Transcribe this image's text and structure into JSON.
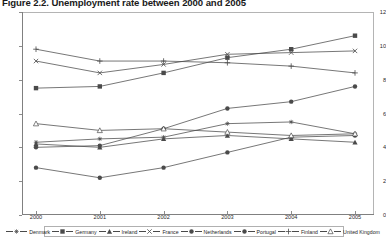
{
  "title": "Figure 2.2. Unemployment rate between 2000 and 2005",
  "axis": {
    "yticks": [
      "12",
      "10",
      "8",
      "6",
      "4",
      "2",
      "0"
    ],
    "xticks": [
      "2000",
      "2001",
      "2002",
      "2003",
      "2004",
      "2005"
    ]
  },
  "legend": {
    "items": [
      {
        "label": "Denmark",
        "marker": "asterisk-marker"
      },
      {
        "label": "Germany",
        "marker": "filled-square-marker"
      },
      {
        "label": "Ireland",
        "marker": "filled-triangle-marker"
      },
      {
        "label": "France",
        "marker": "cross-x-marker"
      },
      {
        "label": "Netherlands",
        "marker": "filled-circle-marker"
      },
      {
        "label": "Portugal",
        "marker": "filled-circle-marker"
      },
      {
        "label": "Finland",
        "marker": "plus-marker"
      },
      {
        "label": "United Kingdom",
        "marker": "open-triangle-marker"
      }
    ]
  },
  "chart_data": {
    "type": "line",
    "title": "Figure 2.2. Unemployment rate between 2000 and 2005",
    "xlabel": "",
    "ylabel": "",
    "x": [
      2000,
      2001,
      2002,
      2003,
      2004,
      2005
    ],
    "categories": [
      "2000",
      "2001",
      "2002",
      "2003",
      "2004",
      "2005"
    ],
    "ylim": [
      0,
      12
    ],
    "xlim": [
      2000,
      2005
    ],
    "yticks": [
      0,
      2,
      4,
      6,
      8,
      10,
      12
    ],
    "grid": false,
    "legend_position": "bottom",
    "series": [
      {
        "name": "Denmark",
        "marker": "asterisk",
        "values": [
          4.3,
          4.5,
          4.6,
          5.4,
          5.5,
          4.8
        ]
      },
      {
        "name": "Germany",
        "marker": "filled-square",
        "values": [
          7.5,
          7.6,
          8.4,
          9.3,
          9.8,
          10.6
        ]
      },
      {
        "name": "Ireland",
        "marker": "filled-triangle",
        "values": [
          4.2,
          4.0,
          4.5,
          4.7,
          4.5,
          4.3
        ]
      },
      {
        "name": "France",
        "marker": "cross-x",
        "values": [
          9.1,
          8.4,
          8.9,
          9.5,
          9.6,
          9.7
        ]
      },
      {
        "name": "Netherlands",
        "marker": "filled-circle",
        "values": [
          2.8,
          2.2,
          2.8,
          3.7,
          4.6,
          4.7
        ]
      },
      {
        "name": "Portugal",
        "marker": "filled-circle",
        "values": [
          4.0,
          4.1,
          5.1,
          6.3,
          6.7,
          7.6
        ]
      },
      {
        "name": "Finland",
        "marker": "plus",
        "values": [
          9.8,
          9.1,
          9.1,
          9.0,
          8.8,
          8.4
        ]
      },
      {
        "name": "United Kingdom",
        "marker": "open-triangle",
        "values": [
          5.4,
          5.0,
          5.1,
          4.9,
          4.7,
          4.8
        ]
      }
    ]
  },
  "colors": {
    "line": "#4a4a4a",
    "axis": "#8c8c8c",
    "text": "#1f1f1f"
  }
}
